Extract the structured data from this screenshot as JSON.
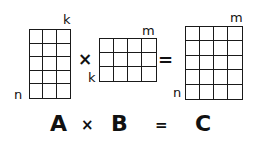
{
  "diagram": {
    "matrices": {
      "A": {
        "name": "A",
        "rows": 5,
        "cols": 3,
        "row_label": "n",
        "col_label": "k"
      },
      "B": {
        "name": "B",
        "rows": 3,
        "cols": 4,
        "row_label": "k",
        "col_label": "m"
      },
      "C": {
        "name": "C",
        "rows": 5,
        "cols": 4,
        "row_label": "n",
        "col_label": "m"
      }
    },
    "operators": {
      "multiply": "×",
      "equals": "="
    },
    "equation": {
      "a": "A",
      "times": "×",
      "b": "B",
      "equals": "=",
      "c": "C"
    },
    "line_color": "#1a1a1a",
    "background": "#ffffff"
  }
}
